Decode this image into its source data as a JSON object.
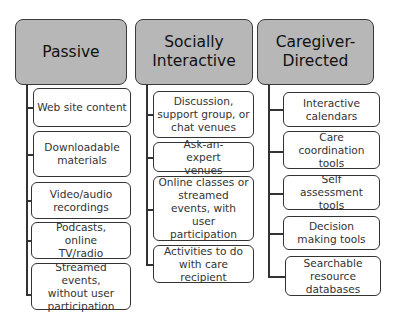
{
  "columns": [
    {
      "title": "Passive",
      "items": [
        "Web site content",
        "Downloadable materials",
        "Video/audio recordings",
        "Podcasts, online TV/radio",
        "Streamed events, without user participation"
      ]
    },
    {
      "title": "Socially Interactive",
      "items": [
        "Discussion, support group, or chat venues",
        "Ask-an-expert venues",
        "Online classes or streamed events, with user participation",
        "Activities to do with care recipient"
      ]
    },
    {
      "title": "Caregiver-Directed",
      "items": [
        "Interactive calendars",
        "Care coordination tools",
        "Self assessment tools",
        "Decision making tools",
        "Searchable resource databases"
      ]
    }
  ],
  "colors": {
    "header_fill": "#b7b7b7",
    "border": "#333333",
    "child_fill": "#ffffff"
  }
}
